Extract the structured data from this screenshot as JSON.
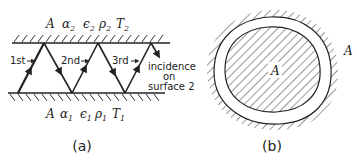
{
  "panel_a": {
    "caption": "(a)",
    "top_surface": {
      "A": "A",
      "alpha": "α",
      "eps": "ϵ",
      "rho": "ρ",
      "T": "T",
      "sub": "2"
    },
    "bottom_surface": {
      "A": "A",
      "alpha": "α",
      "eps": "ϵ",
      "rho": "ρ",
      "T": "T",
      "sub": "1"
    },
    "incidence_labels": [
      "1st",
      "2nd",
      "3rd"
    ],
    "note": [
      "incidence",
      "on",
      "surface 2"
    ]
  },
  "panel_b": {
    "caption": "(b)",
    "inner_label": "A",
    "outer_label": "A"
  },
  "colors": {
    "ink": "#222222",
    "background": "#ffffff"
  }
}
